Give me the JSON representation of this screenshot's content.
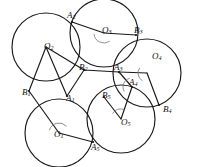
{
  "figure": {
    "background_color": "#ffffff",
    "stroke_color": "#1a1a1a",
    "arc_color": "#7d7d7d",
    "width": 200,
    "height": 167,
    "centers": [
      {
        "id": "O1",
        "base": "O",
        "sub": "1",
        "x": 59,
        "y": 133,
        "r": 34,
        "label_x": 54,
        "label_y": 135
      },
      {
        "id": "O2",
        "base": "O",
        "sub": "2",
        "x": 46,
        "y": 47,
        "r": 34,
        "label_x": 44,
        "label_y": 47
      },
      {
        "id": "O3",
        "base": "O",
        "sub": "3",
        "x": 104,
        "y": 33,
        "r": 34,
        "label_x": 102,
        "label_y": 31
      },
      {
        "id": "O4",
        "base": "O",
        "sub": "4",
        "x": 147,
        "y": 73,
        "r": 34,
        "label_x": 152,
        "label_y": 57
      },
      {
        "id": "O5",
        "base": "O",
        "sub": "5",
        "x": 121,
        "y": 119,
        "r": 34,
        "label_x": 121,
        "label_y": 123
      }
    ],
    "points": [
      {
        "id": "A1",
        "base": "A",
        "sub": "1",
        "x": 67,
        "y": 96,
        "label_x": 66,
        "label_y": 99
      },
      {
        "id": "A2",
        "base": "A",
        "sub": "2",
        "x": 72,
        "y": 22,
        "label_x": 67,
        "label_y": 16
      },
      {
        "id": "A3",
        "base": "A",
        "sub": "3",
        "x": 119,
        "y": 72,
        "label_x": 114,
        "label_y": 68
      },
      {
        "id": "A4",
        "base": "A",
        "sub": "4",
        "x": 132,
        "y": 87,
        "label_x": 129,
        "label_y": 83
      },
      {
        "id": "A5",
        "base": "A",
        "sub": "5",
        "x": 93,
        "y": 142,
        "label_x": 91,
        "label_y": 148
      },
      {
        "id": "B1",
        "base": "B",
        "sub": "1",
        "x": 29,
        "y": 91,
        "label_x": 22,
        "label_y": 93
      },
      {
        "id": "B2",
        "base": "B",
        "sub": "2",
        "x": 84,
        "y": 70,
        "label_x": 79,
        "label_y": 68
      },
      {
        "id": "B3",
        "base": "B",
        "sub": "3",
        "x": 136,
        "y": 35,
        "label_x": 134,
        "label_y": 31
      },
      {
        "id": "B4",
        "base": "B",
        "sub": "4",
        "x": 159,
        "y": 105,
        "label_x": 163,
        "label_y": 110
      },
      {
        "id": "B5",
        "base": "B",
        "sub": "5",
        "x": 104,
        "y": 97,
        "label_x": 102,
        "label_y": 96
      }
    ],
    "segments": [
      {
        "name": "segment-O1-B1",
        "from": "O1",
        "to": "B1"
      },
      {
        "name": "segment-O1-A5",
        "from": "O1",
        "to": "A5"
      },
      {
        "name": "segment-O2-B1",
        "from": "O2",
        "to": "B1"
      },
      {
        "name": "segment-O2-A1",
        "from": "O2",
        "to": "A1"
      },
      {
        "name": "segment-O2-B2",
        "from": "O2",
        "to": "B2"
      },
      {
        "name": "segment-O3-A2",
        "from": "O3",
        "to": "A2"
      },
      {
        "name": "segment-O3-B3",
        "from": "O3",
        "to": "B3"
      },
      {
        "name": "segment-O4-A3",
        "from": "O4",
        "to": "A3"
      },
      {
        "name": "segment-O4-B4",
        "from": "O4",
        "to": "B4"
      },
      {
        "name": "segment-O5-B5",
        "from": "O5",
        "to": "B5"
      },
      {
        "name": "segment-O5-A4",
        "from": "O5",
        "to": "A4"
      },
      {
        "name": "segment-A1-B2",
        "from": "A1",
        "to": "B2"
      },
      {
        "name": "segment-B2-A3",
        "from": "B2",
        "to": "A3"
      },
      {
        "name": "segment-A3-A4",
        "from": "A3",
        "to": "A4"
      }
    ],
    "angle_marks": [
      {
        "name": "angle-mark-O1",
        "center": "O1",
        "radius": 10,
        "start_deg": 195,
        "end_deg": 318
      },
      {
        "name": "angle-mark-O3",
        "center": "O3",
        "radius": 10,
        "start_deg": 55,
        "end_deg": 175
      },
      {
        "name": "angle-mark-O4",
        "center": "O4",
        "radius": 9,
        "start_deg": 120,
        "end_deg": 215
      },
      {
        "name": "angle-mark-O5",
        "center": "O5",
        "radius": 10,
        "start_deg": 212,
        "end_deg": 285
      },
      {
        "name": "angle-mark-A4",
        "center": "A4",
        "radius": 9,
        "start_deg": 150,
        "end_deg": 255
      }
    ]
  }
}
